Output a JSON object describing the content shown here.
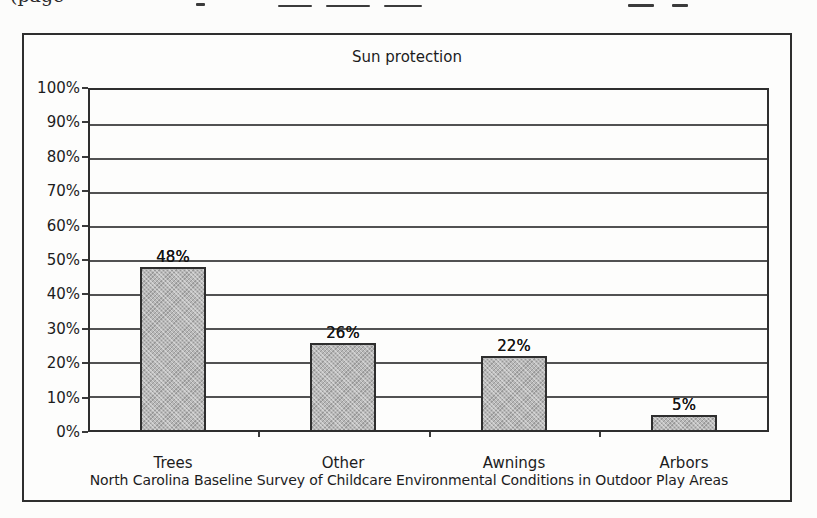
{
  "page": {
    "background": "#fcfcfb",
    "clipped_top_text": "(page"
  },
  "chart_data": {
    "type": "bar",
    "title": "Sun protection",
    "categories": [
      "Trees",
      "Other",
      "Awnings",
      "Arbors"
    ],
    "values": [
      48,
      26,
      22,
      5
    ],
    "value_labels": [
      "48%",
      "26%",
      "22%",
      "5%"
    ],
    "y_ticks": [
      "100%",
      "90%",
      "80%",
      "70%",
      "60%",
      "50%",
      "40%",
      "30%",
      "20%",
      "10%",
      "0%"
    ],
    "ylim": [
      0,
      100
    ],
    "y_step": 10,
    "grid": "horizontal-on",
    "legend": "none",
    "xlabel": "",
    "ylabel": "",
    "caption": "North Carolina Baseline Survey of Childcare Environmental Conditions in Outdoor Play Areas",
    "colors": {
      "bar_fill": "#b8b8b8",
      "bar_border": "#2e2e2e",
      "grid_line": "#3a3a3a",
      "text": "#1c1c1c",
      "frame": "#2e2e2e"
    }
  }
}
